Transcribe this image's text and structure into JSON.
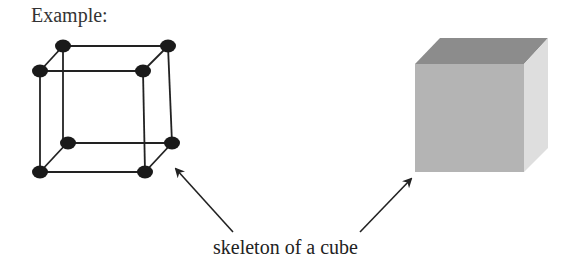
{
  "title": "Example:",
  "caption": "skeleton of a cube",
  "colors": {
    "line": "#222222",
    "node": "#1a1a1a",
    "cube_top": "#8c8c8c",
    "cube_front": "#b4b4b4",
    "cube_side": "#dedede"
  }
}
